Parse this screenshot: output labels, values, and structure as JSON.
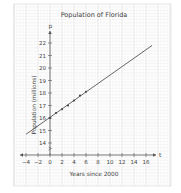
{
  "chart_data": {
    "type": "scatter",
    "title": "Population of Florida",
    "xlabel": "Years since 2000",
    "ylabel": "Population (millions)",
    "x_axis_var": "t",
    "y_axis_var": "p",
    "xlim": [
      -4,
      17
    ],
    "ylim": [
      13,
      22.5
    ],
    "x_ticks": [
      -4,
      -2,
      0,
      2,
      4,
      6,
      8,
      10,
      12,
      14,
      16
    ],
    "y_ticks": [
      14,
      15,
      16,
      17,
      18,
      19,
      20,
      21,
      22
    ],
    "grid": true,
    "series": [
      {
        "name": "Population data",
        "type": "scatter",
        "x": [
          0,
          1,
          2,
          3,
          4,
          5,
          6
        ],
        "y": [
          16.0,
          16.4,
          16.7,
          17.0,
          17.4,
          17.8,
          18.1
        ]
      },
      {
        "name": "Trend line",
        "type": "line",
        "x": [
          -4,
          17
        ],
        "y": [
          14.7,
          21.8
        ]
      }
    ]
  },
  "labels": {
    "title": "Population of Florida",
    "xlabel": "Years since 2000",
    "ylabel": "Population (millions)",
    "x_var": "t",
    "y_var": "p",
    "x_ticks": [
      "−4",
      "−2",
      "0",
      "2",
      "4",
      "6",
      "8",
      "10",
      "12",
      "14",
      "16"
    ],
    "y_ticks": [
      "14",
      "15",
      "16",
      "17",
      "18",
      "19",
      "20",
      "21",
      "22"
    ]
  }
}
